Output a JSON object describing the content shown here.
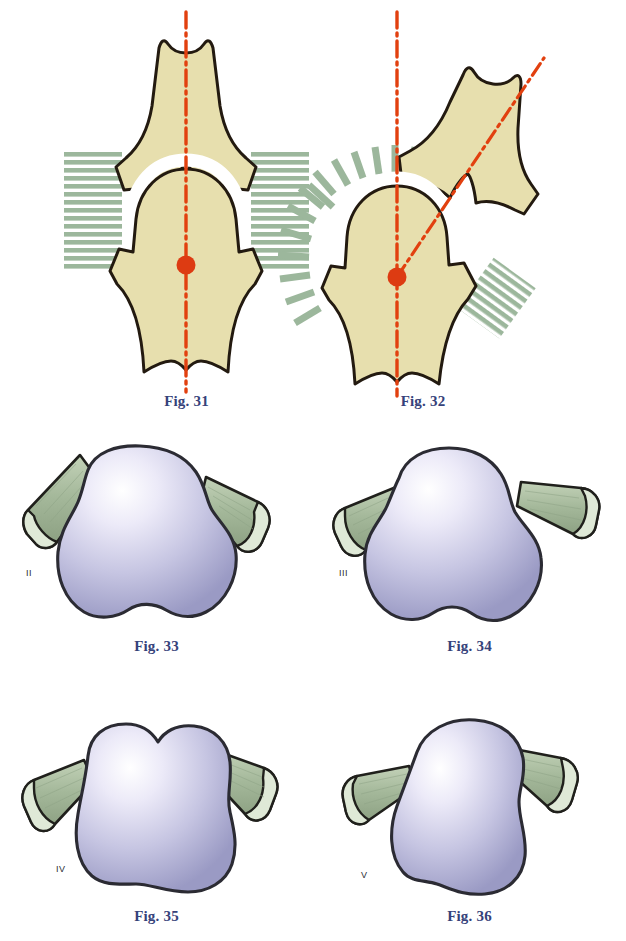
{
  "plate": {
    "background_color": "#ffffff",
    "width": 626,
    "height": 941
  },
  "palette": {
    "bone_fill": "#e7dfae",
    "bone_outline": "#231a10",
    "joint_space": "#ffffff",
    "axis_red": "#e2400f",
    "center_dot": "#dd3b12",
    "hatch_green": "#9cb79c",
    "caption_blue": "#36427a",
    "vertebra_body_light": "#f2f1fb",
    "vertebra_body_mid": "#c9c8e4",
    "vertebra_body_dark": "#9a9ac4",
    "vertebra_outline": "#2b2b33",
    "process_green": "#a9bca0",
    "process_green_dark": "#8fa487",
    "process_cut_face": "#dfe9d7",
    "process_outline": "#20201c"
  },
  "figures": [
    {
      "id": "fig31",
      "caption": "Fig. 31",
      "kind": "joint-alignment-diagram",
      "roman": null,
      "description": "Normal aligned joint: upper and lower bone share one vertical mechanical axis through the joint centre; symmetric horizontal hatching on both sides.",
      "axis_label": "vertical-mechanical-axis",
      "hatch_style": "horizontal",
      "deviation_deg": 0
    },
    {
      "id": "fig32",
      "caption": "Fig. 32",
      "kind": "joint-alignment-diagram",
      "roman": null,
      "description": "Deviated joint: upper bone shaft is angulated laterally, its axis diverging from the vertical axis through the joint centre; hatching radiates as a fan.",
      "axis_label": "deviated-axis",
      "hatch_style": "radial",
      "deviation_deg": 38
    },
    {
      "id": "fig33",
      "caption": "Fig. 33",
      "kind": "vertebra-superior-view",
      "roman": "II",
      "description": "Vertebral body, superior view, grade II shape with broad body and paired transverse processes."
    },
    {
      "id": "fig34",
      "caption": "Fig. 34",
      "kind": "vertebra-superior-view",
      "roman": "III",
      "description": "Vertebral body, superior view, grade III shape, slightly wider and more rounded."
    },
    {
      "id": "fig35",
      "caption": "Fig. 35",
      "kind": "vertebra-superior-view",
      "roman": "IV",
      "description": "Vertebral body, superior view, grade IV shape with notched superior border."
    },
    {
      "id": "fig36",
      "caption": "Fig. 36",
      "kind": "vertebra-superior-view",
      "roman": "V",
      "description": "Vertebral body, superior view, grade V shape, asymmetric and obliquely tilted."
    }
  ]
}
